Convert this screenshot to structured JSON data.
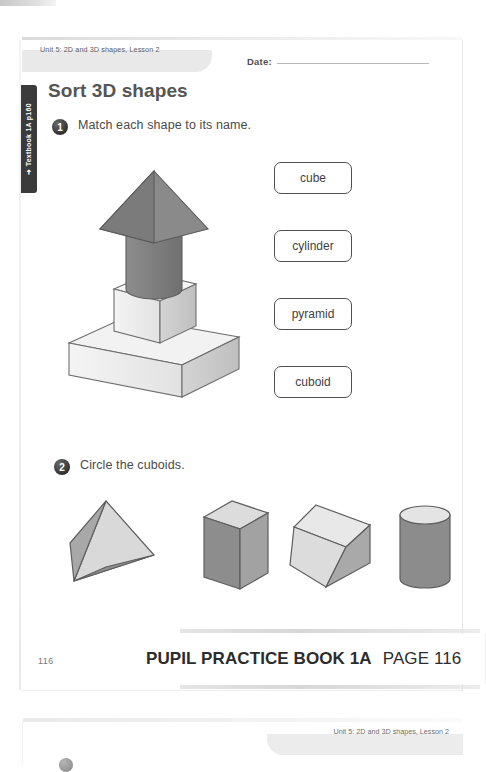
{
  "page": {
    "unit_label": "Unit 5: 2D and 3D shapes, Lesson 2",
    "date_label": "Date:",
    "side_tab_label": "➜ Textbook 1A p160",
    "title": "Sort 3D shapes",
    "page_number": "116"
  },
  "questions": [
    {
      "number": "1",
      "text": "Match each shape to its name."
    },
    {
      "number": "2",
      "text": "Circle the cuboids."
    }
  ],
  "name_boxes": [
    {
      "label": "cube"
    },
    {
      "label": "cylinder"
    },
    {
      "label": "pyramid"
    },
    {
      "label": "cuboid"
    }
  ],
  "tower_shapes": [
    {
      "name": "pyramid",
      "shade": "grey"
    },
    {
      "name": "cylinder",
      "shade": "grey"
    },
    {
      "name": "cube",
      "shade": "white"
    },
    {
      "name": "cuboid",
      "shade": "white"
    }
  ],
  "q2_shapes": [
    {
      "name": "triangular-pyramid",
      "shade": "light"
    },
    {
      "name": "cuboid-upright",
      "shade": "grey"
    },
    {
      "name": "cuboid-tilted",
      "shade": "light"
    },
    {
      "name": "cylinder",
      "shade": "grey"
    }
  ],
  "footer": {
    "book": "PUPIL PRACTICE BOOK 1A",
    "page": "PAGE 116"
  },
  "next_page": {
    "unit_label": "Unit 5: 2D and 3D shapes, Lesson 2"
  },
  "colors": {
    "title": "#555555",
    "text": "#4a4a4a",
    "box_border": "#4f4f4f",
    "tab_dark": "#3b3b3b",
    "tab_grey": "#e9e9e9",
    "shape_grey": "#8a8a8a",
    "shape_light": "#dcdcdc"
  }
}
